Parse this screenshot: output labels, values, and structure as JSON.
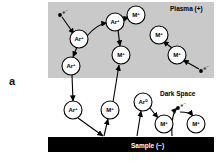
{
  "figure": {
    "panel_label": "a",
    "regions": [
      {
        "id": "plasma",
        "label": "Plasma (+)",
        "fill": "#c9c9c9",
        "x": 48,
        "y": 2,
        "w": 166,
        "h": 76
      },
      {
        "id": "dark-space",
        "label": "Dark Space",
        "fill": "#ffffff",
        "x": 48,
        "y": 78,
        "w": 166,
        "h": 59
      },
      {
        "id": "sample",
        "label": "Sample (−)",
        "fill": "#000000",
        "x": 48,
        "y": 137,
        "w": 166,
        "h": 15
      }
    ],
    "region_label_positions": {
      "plasma": {
        "x": 170,
        "y": 7,
        "color": "#000000"
      },
      "dark_space": {
        "x": 160,
        "y": 92,
        "color": "#000000"
      },
      "sample": {
        "x": 131,
        "y": 148,
        "color": "#ffffff"
      }
    },
    "colors": {
      "plasma_fill": "#c9c9c9",
      "sample_fill": "#000000",
      "particle_fill": "#ffffff",
      "stroke": "#000000",
      "text": "#000000",
      "sample_text": "#ffffff"
    },
    "particles": [
      {
        "id": "p1",
        "species": "Ar",
        "charge": "+",
        "label": "Ar",
        "sup": "+",
        "cx": 79,
        "cy": 39,
        "r": 9
      },
      {
        "id": "p2",
        "species": "Ar",
        "charge": "+",
        "label": "Ar",
        "sup": "+",
        "cx": 115,
        "cy": 22,
        "r": 9
      },
      {
        "id": "p3",
        "species": "M",
        "charge": "+",
        "label": "M",
        "sup": "+",
        "cx": 136,
        "cy": 15,
        "r": 9
      },
      {
        "id": "p4",
        "species": "M",
        "charge": "+",
        "label": "M",
        "sup": "+",
        "cx": 121,
        "cy": 55,
        "r": 9
      },
      {
        "id": "p5",
        "species": "Ar",
        "charge": "+",
        "label": "Ar",
        "sup": "+",
        "cx": 71,
        "cy": 66,
        "r": 9
      },
      {
        "id": "p6",
        "species": "M",
        "charge": "+",
        "label": "M",
        "sup": "+",
        "cx": 159,
        "cy": 35,
        "r": 9
      },
      {
        "id": "p7",
        "species": "M",
        "charge": "+",
        "label": "M",
        "sup": "+",
        "cx": 177,
        "cy": 55,
        "r": 9
      },
      {
        "id": "p8",
        "species": "Ar",
        "charge": "+",
        "label": "Ar",
        "sup": "+",
        "cx": 73,
        "cy": 110,
        "r": 9
      },
      {
        "id": "p9",
        "species": "M",
        "charge": "+",
        "label": "M",
        "sup": "+",
        "cx": 110,
        "cy": 110,
        "r": 9
      },
      {
        "id": "p10",
        "species": "Ar",
        "charge": "0",
        "label": "Ar",
        "sup": "0",
        "cx": 143,
        "cy": 102,
        "r": 9
      },
      {
        "id": "p11",
        "species": "M",
        "charge": "+",
        "label": "M",
        "sup": "+",
        "cx": 164,
        "cy": 124,
        "r": 9
      },
      {
        "id": "p12",
        "species": "M",
        "charge": "+",
        "label": "M",
        "sup": "+",
        "cx": 196,
        "cy": 124,
        "r": 9
      }
    ],
    "electrons": [
      {
        "id": "e1",
        "label": "e",
        "sup": "−",
        "x": 60,
        "y": 15
      },
      {
        "id": "e2",
        "label": "e",
        "sup": "−",
        "x": 201,
        "y": 71
      },
      {
        "id": "e3",
        "label": "e",
        "sup": "−",
        "x": 178,
        "y": 108
      }
    ],
    "arrows": [
      {
        "id": "a1",
        "from": "e1",
        "to": "p1",
        "kind": "straight"
      },
      {
        "id": "a2",
        "from": "p1",
        "to": "p2",
        "kind": "curved"
      },
      {
        "id": "a3",
        "from": "p2",
        "to": "p3",
        "kind": "straight"
      },
      {
        "id": "a4",
        "from": "p2",
        "to": "p4",
        "kind": "straight"
      },
      {
        "id": "a5",
        "from": "p1",
        "to": "p5",
        "kind": "straight"
      },
      {
        "id": "a6",
        "from": "p7",
        "to": "p6",
        "kind": "straight"
      },
      {
        "id": "a7",
        "from": "e2",
        "to": "p7",
        "kind": "straight"
      },
      {
        "id": "a8",
        "from": "p5",
        "to": "p8",
        "kind": "straight"
      },
      {
        "id": "a9",
        "from": "p8",
        "to": "sample",
        "kind": "straight"
      },
      {
        "id": "a10",
        "from": "p4",
        "to": "p9",
        "kind": "straight-up"
      },
      {
        "id": "a11",
        "from": "sample",
        "to": "p9",
        "kind": "straight"
      },
      {
        "id": "a12",
        "from": "p10",
        "to": "p11",
        "kind": "straight"
      },
      {
        "id": "a13",
        "from": "sample",
        "to": "p10",
        "kind": "straight"
      },
      {
        "id": "a14",
        "from": "e3",
        "to": "p12",
        "kind": "curved"
      },
      {
        "id": "a15",
        "from": "sample",
        "to": "e3",
        "kind": "curved"
      }
    ]
  }
}
